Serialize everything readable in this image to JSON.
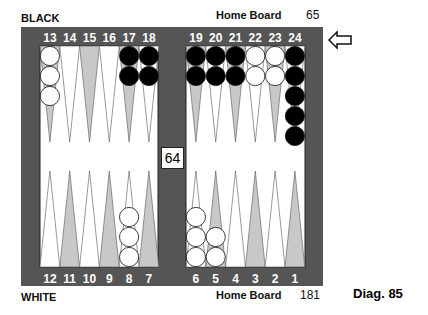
{
  "top_label": "BLACK",
  "bottom_label": "WHITE",
  "top_home": "Home Board",
  "bottom_home": "Home Board",
  "top_pips": "65",
  "bottom_pips": "181",
  "cube": "64",
  "caption": "Diag. 85",
  "top_points": [
    "13",
    "14",
    "15",
    "16",
    "17",
    "18",
    "19",
    "20",
    "21",
    "22",
    "23",
    "24"
  ],
  "bottom_points": [
    "12",
    "11",
    "10",
    "9",
    "8",
    "7",
    "6",
    "5",
    "4",
    "3",
    "2",
    "1"
  ],
  "colors": {
    "frame": "#555555",
    "shade": "#c8c8c8",
    "black": "#000000",
    "white": "#ffffff"
  },
  "checkers": {
    "13": {
      "color": "white",
      "count": 3
    },
    "17": {
      "color": "black",
      "count": 2
    },
    "18": {
      "color": "black",
      "count": 2
    },
    "19": {
      "color": "black",
      "count": 2
    },
    "20": {
      "color": "black",
      "count": 2
    },
    "21": {
      "color": "black",
      "count": 2
    },
    "22": {
      "color": "white",
      "count": 2
    },
    "23": {
      "color": "white",
      "count": 2
    },
    "24": {
      "color": "black",
      "count": 5
    },
    "8": {
      "color": "white",
      "count": 3
    },
    "6": {
      "color": "white",
      "count": 3
    },
    "5": {
      "color": "white",
      "count": 2
    }
  }
}
